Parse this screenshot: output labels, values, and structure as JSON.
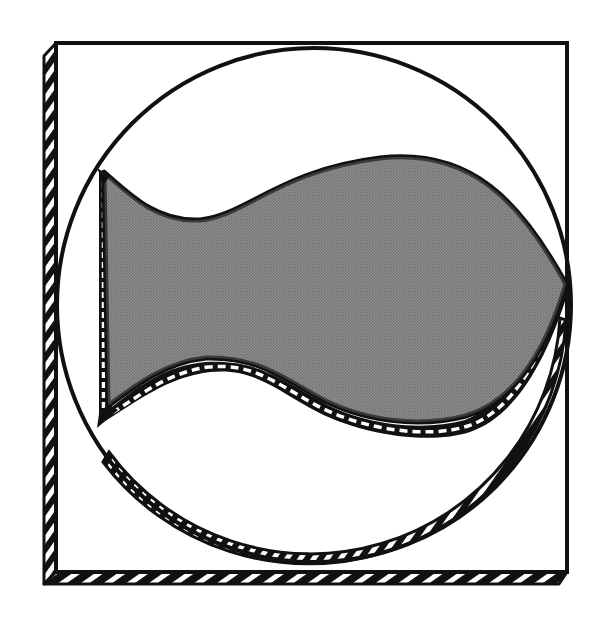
{
  "figure": {
    "title": "",
    "colors": {
      "ink": "#111111",
      "fill_gray": "#8a8a8a",
      "background": "#ffffff",
      "hatch_light": "#ffffff"
    },
    "elements": {
      "square_frame": "square-frame",
      "circle": "circle",
      "fish_shape": "fish-shape"
    }
  }
}
